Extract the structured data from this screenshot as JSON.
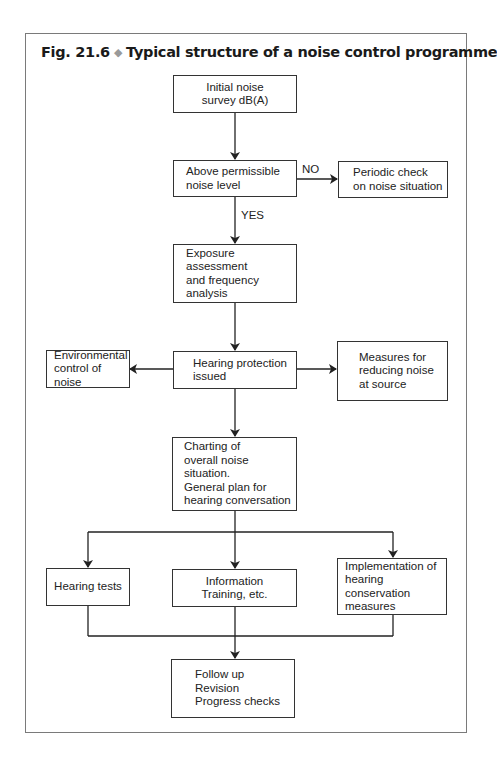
{
  "figure": {
    "title_prefix": "Fig. 21.6",
    "title_separator_icon": "◆",
    "title_text": "Typical structure of a noise control programme"
  },
  "nodes": {
    "initial_survey": "Initial noise\nsurvey dB(A)",
    "above_permissible": "Above permissible\nnoise level",
    "periodic_check": "Periodic check\non noise situation",
    "exposure_assessment": "Exposure assessment\nand frequency\nanalysis",
    "environmental_control": "Environmental\ncontrol of noise",
    "hearing_protection": "Hearing protection\nissued",
    "measures_source": "Measures for\nreducing noise\nat source",
    "charting": "Charting of\noverall noise situation.\nGeneral plan for\nhearing conversation",
    "hearing_tests": "Hearing tests",
    "information_training": "Information\nTraining, etc.",
    "implementation": "Implementation of\nhearing conservation\nmeasures",
    "follow_up": "Follow up\nRevision\nProgress checks"
  },
  "edge_labels": {
    "no": "NO",
    "yes": "YES"
  },
  "colors": {
    "frame": "#7a7a7a",
    "line": "#222222",
    "diamond": "#9a9a9a"
  }
}
